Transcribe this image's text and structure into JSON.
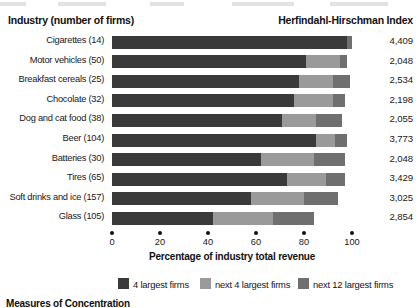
{
  "header": {
    "industry_title": "Industry (number of firms)",
    "hhi_title": "Herfindahl-Hirschman Index"
  },
  "axis": {
    "title": "Percentage of industry total revenue",
    "ticks": [
      "0",
      "20",
      "40",
      "60",
      "80",
      "100"
    ],
    "tick_values": [
      0,
      20,
      40,
      60,
      80,
      100
    ]
  },
  "legend": {
    "items": [
      {
        "label": "4 largest firms",
        "color": "#3a3a3a"
      },
      {
        "label": "next 4 largest firms",
        "color": "#9a9a9a"
      },
      {
        "label": "next 12 largest firms",
        "color": "#6f6f6f"
      }
    ]
  },
  "footer": {
    "caption": "Measures of Concentration"
  },
  "chart_data": {
    "type": "bar",
    "orientation": "horizontal",
    "stacked": true,
    "title": "",
    "xlabel": "Percentage of industry total revenue",
    "ylabel": "Industry (number of firms)",
    "xlim": [
      0,
      100
    ],
    "grid": false,
    "legend_position": "bottom",
    "categories": [
      "Cigarettes (14)",
      "Motor vehicles (50)",
      "Breakfast cereals (25)",
      "Chocolate (32)",
      "Dog and cat food (38)",
      "Beer (104)",
      "Batteries (30)",
      "Tires (65)",
      "Soft drinks and ice (157)",
      "Glass (105)"
    ],
    "series": [
      {
        "name": "4 largest firms",
        "color": "#3a3a3a",
        "values": [
          98,
          81,
          78,
          76,
          71,
          85,
          62,
          73,
          58,
          42
        ]
      },
      {
        "name": "next 4 largest firms",
        "color": "#9a9a9a",
        "values": [
          0,
          14,
          14,
          16,
          14,
          8,
          22,
          16,
          22,
          25
        ]
      },
      {
        "name": "next 12 largest firms",
        "color": "#6f6f6f",
        "values": [
          2,
          3,
          7,
          5,
          11,
          5,
          13,
          8,
          14,
          17
        ]
      }
    ],
    "secondary_axis": {
      "name": "Herfindahl-Hirschman Index",
      "labels": [
        "4,409",
        "2,048",
        "2,534",
        "2,198",
        "2,055",
        "3,773",
        "2,048",
        "3,429",
        "3,025",
        "2,854"
      ],
      "values": [
        4409,
        2048,
        2534,
        2198,
        2055,
        3773,
        2048,
        3429,
        3025,
        2854
      ]
    }
  }
}
